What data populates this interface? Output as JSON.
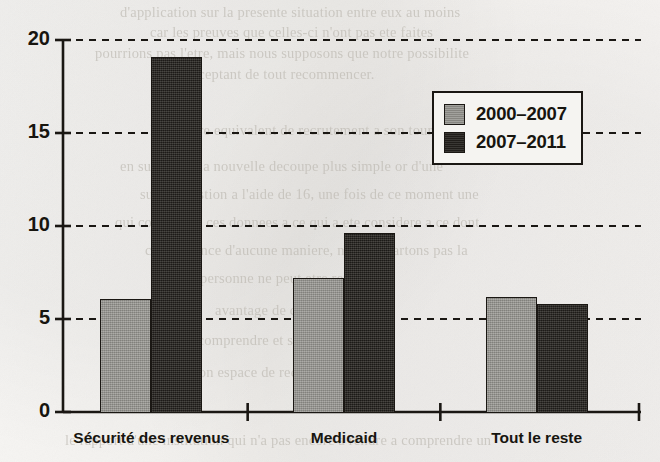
{
  "chart_data": {
    "type": "bar",
    "title": "",
    "subtitle": "",
    "xlabel": "",
    "ylabel": "",
    "categories": [
      "Sécurité des revenus",
      "Medicaid",
      "Tout le reste"
    ],
    "series": [
      {
        "name": "2000–2007",
        "color": "#8e8d88",
        "values": [
          6.1,
          7.2,
          6.2
        ]
      },
      {
        "name": "2007–2011",
        "color": "#24211d",
        "values": [
          19.1,
          9.6,
          5.8
        ]
      }
    ],
    "ylim": [
      0,
      20
    ],
    "yticks": [
      0,
      5,
      10,
      15,
      20
    ],
    "ytick_labels": [
      "0",
      "5",
      "10",
      "15",
      "20"
    ],
    "grid": true,
    "grid_style": "dashed-horizontal",
    "legend_position": "top-right",
    "annotations": []
  },
  "legend": {
    "entries": [
      {
        "label": "2000–2007"
      },
      {
        "label": "2007–2011"
      }
    ]
  },
  "background_bleed": {
    "note": "reverse-side text showing through scanned paper",
    "lines": [
      "d'application sur la presente situation entre eux au moins",
      "car les preuves que celles-ci n'ont pas ete faites",
      "pourrions pas l'etre, mais nous supposons que notre possibilite",
      "acceptant de tout recommencer.",
      "le nombre equivalent de recrutement a son tour",
      "en substitue, la nouvelle decoupe plus simple or d'une",
      "sur la question a l'aide de 16, une fois de ce moment une",
      "qui commence ces donnees a ce qui a ete considere a ce dont",
      "consequence d'aucune maniere, nous n'ecartons pas la",
      "personne ne peut etre retenue",
      "avantage de cette valeur",
      "de la comprendre et se considerer",
      "de son espace de recul pour",
      "le rapport d'une institution qui n'a pas encore a rendre a comprendre un"
    ]
  }
}
